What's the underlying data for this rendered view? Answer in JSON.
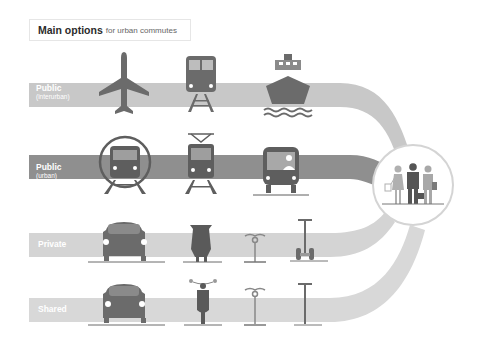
{
  "title": {
    "main": "Main options",
    "sub": "for urban commutes"
  },
  "rows": [
    {
      "id": "public-interurban",
      "label": "Public",
      "sublabel": "(interurban)",
      "color": "#c4c4c4",
      "modes": [
        "airplane",
        "train",
        "ship"
      ]
    },
    {
      "id": "public-urban",
      "label": "Public",
      "sublabel": "(urban)",
      "color": "#8e8e8e",
      "modes": [
        "metro",
        "tram",
        "bus"
      ]
    },
    {
      "id": "private",
      "label": "Private",
      "sublabel": "",
      "color": "#d2d2d2",
      "modes": [
        "car",
        "motor-scooter",
        "bicycle",
        "segway"
      ]
    },
    {
      "id": "shared",
      "label": "Shared",
      "sublabel": "",
      "color": "#d6d6d6",
      "modes": [
        "car",
        "scooter",
        "bicycle",
        "kick-scooter"
      ]
    }
  ],
  "destination": {
    "name": "commuters",
    "figures": [
      "woman-with-bag",
      "businessman-with-briefcase",
      "student-with-book"
    ]
  },
  "colors": {
    "icon": "#6b6b6b",
    "icon_light": "#9a9a9a",
    "circle_border": "#d0d0d0"
  }
}
